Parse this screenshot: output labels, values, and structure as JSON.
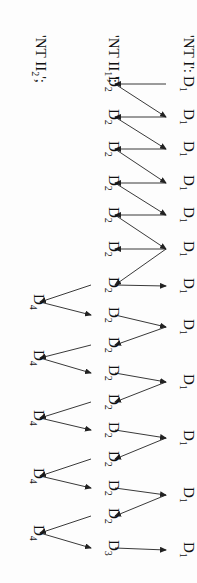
{
  "diagram": {
    "orientation": "rotated-90-clockwise",
    "colors": {
      "ink": "#111111",
      "background": "#fdfdfd"
    },
    "row_labels": [
      {
        "text": "'NT I':",
        "x": 178,
        "y": 35
      },
      {
        "text": "'NT II",
        "sub": "1",
        "tail": "';",
        "x": 103,
        "y": 35
      },
      {
        "text": "'NT II",
        "sub": "2",
        "tail": "';",
        "x": 30,
        "y": 35
      }
    ],
    "nodes": [
      {
        "id": "a1",
        "base": "D",
        "sub": "1",
        "x": 178,
        "y": 84
      },
      {
        "id": "b1",
        "base": "D",
        "sub": "2",
        "x": 103,
        "y": 84
      },
      {
        "id": "a2",
        "base": "D",
        "sub": "1",
        "x": 178,
        "y": 117
      },
      {
        "id": "b2",
        "base": "D",
        "sub": "2",
        "x": 103,
        "y": 117
      },
      {
        "id": "a3",
        "base": "D",
        "sub": "1",
        "x": 178,
        "y": 149
      },
      {
        "id": "b3",
        "base": "D",
        "sub": "2",
        "x": 103,
        "y": 149
      },
      {
        "id": "a4",
        "base": "D",
        "sub": "1",
        "x": 178,
        "y": 183
      },
      {
        "id": "b4",
        "base": "D",
        "sub": "2",
        "x": 103,
        "y": 183
      },
      {
        "id": "a5",
        "base": "D",
        "sub": "1",
        "x": 178,
        "y": 215
      },
      {
        "id": "b5",
        "base": "D",
        "sub": "2",
        "x": 103,
        "y": 215
      },
      {
        "id": "a6",
        "base": "D",
        "sub": "1",
        "x": 178,
        "y": 249
      },
      {
        "id": "b6",
        "base": "D",
        "sub": "2",
        "x": 103,
        "y": 249
      },
      {
        "id": "b7",
        "base": "D",
        "sub": "2",
        "x": 103,
        "y": 285
      },
      {
        "id": "a7",
        "base": "D",
        "sub": "1",
        "x": 178,
        "y": 286
      },
      {
        "id": "c1",
        "base": "D",
        "sub": "4",
        "x": 28,
        "y": 302
      },
      {
        "id": "b8",
        "base": "D",
        "sub": "2",
        "x": 103,
        "y": 315
      },
      {
        "id": "a8",
        "base": "D",
        "sub": "1",
        "x": 178,
        "y": 327
      },
      {
        "id": "b9",
        "base": "D",
        "sub": "2",
        "x": 103,
        "y": 345
      },
      {
        "id": "c2",
        "base": "D",
        "sub": "4",
        "x": 28,
        "y": 358
      },
      {
        "id": "b10",
        "base": "D",
        "sub": "2",
        "x": 103,
        "y": 373
      },
      {
        "id": "a9",
        "base": "D",
        "sub": "1",
        "x": 178,
        "y": 382
      },
      {
        "id": "b11",
        "base": "D",
        "sub": "2",
        "x": 103,
        "y": 402
      },
      {
        "id": "c3",
        "base": "D",
        "sub": "4",
        "x": 28,
        "y": 418
      },
      {
        "id": "b12",
        "base": "D",
        "sub": "2",
        "x": 103,
        "y": 430
      },
      {
        "id": "a10",
        "base": "D",
        "sub": "1",
        "x": 178,
        "y": 438
      },
      {
        "id": "b13",
        "base": "D",
        "sub": "2",
        "x": 103,
        "y": 459
      },
      {
        "id": "c4",
        "base": "D",
        "sub": "4",
        "x": 28,
        "y": 476
      },
      {
        "id": "b14",
        "base": "D",
        "sub": "2",
        "x": 103,
        "y": 488
      },
      {
        "id": "a11",
        "base": "D",
        "sub": "1",
        "x": 178,
        "y": 495
      },
      {
        "id": "b15",
        "base": "D",
        "sub": "2",
        "x": 103,
        "y": 516
      },
      {
        "id": "c5",
        "base": "D",
        "sub": "4",
        "x": 28,
        "y": 533
      },
      {
        "id": "b16",
        "base": "D",
        "sub": "3",
        "x": 103,
        "y": 548
      },
      {
        "id": "a12",
        "base": "D",
        "sub": "1",
        "x": 178,
        "y": 550
      }
    ],
    "edges": [
      [
        "a1",
        "b1"
      ],
      [
        "b1",
        "a2"
      ],
      [
        "a2",
        "b2"
      ],
      [
        "b2",
        "a3"
      ],
      [
        "a3",
        "b3"
      ],
      [
        "b3",
        "a4"
      ],
      [
        "a4",
        "b4"
      ],
      [
        "b4",
        "a5"
      ],
      [
        "a5",
        "b5"
      ],
      [
        "b5",
        "a6"
      ],
      [
        "a6",
        "b6"
      ],
      [
        "a6",
        "b7"
      ],
      [
        "b7",
        "a7"
      ],
      [
        "b7",
        "c1"
      ],
      [
        "c1",
        "b8"
      ],
      [
        "b8",
        "a8"
      ],
      [
        "a8",
        "b9"
      ],
      [
        "b9",
        "c2"
      ],
      [
        "c2",
        "b10"
      ],
      [
        "b10",
        "a9"
      ],
      [
        "a9",
        "b11"
      ],
      [
        "b11",
        "c3"
      ],
      [
        "c3",
        "b12"
      ],
      [
        "b12",
        "a10"
      ],
      [
        "a10",
        "b13"
      ],
      [
        "b13",
        "c4"
      ],
      [
        "c4",
        "b14"
      ],
      [
        "b14",
        "a11"
      ],
      [
        "a11",
        "b15"
      ],
      [
        "b15",
        "c5"
      ],
      [
        "c5",
        "b16"
      ],
      [
        "b16",
        "a12"
      ]
    ]
  }
}
